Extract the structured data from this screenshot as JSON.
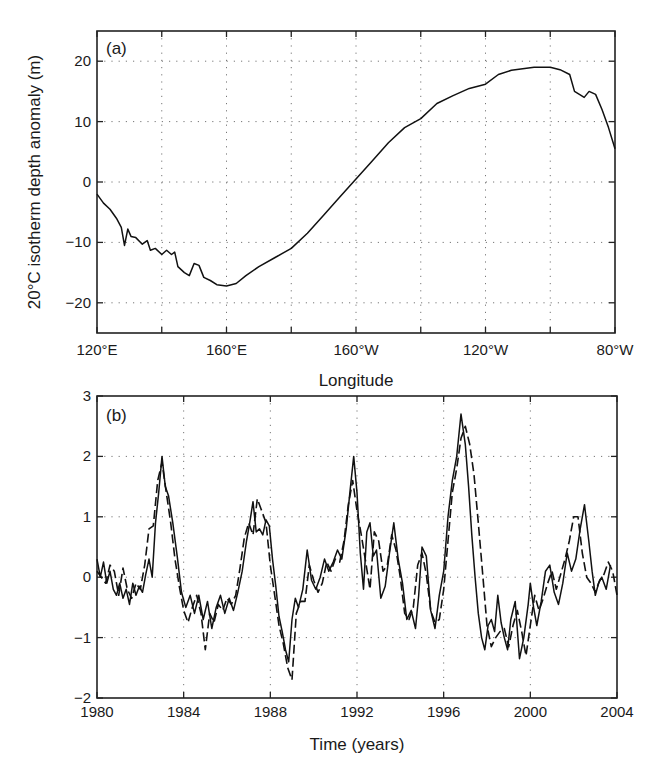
{
  "chart_data": [
    {
      "id": "a",
      "type": "line",
      "panel_label": "(a)",
      "title": "",
      "xlabel": "Longitude",
      "ylabel": "20°C isotherm depth anomaly (m)",
      "xlim": [
        120,
        280
      ],
      "ylim": [
        -25,
        25
      ],
      "x_ticks": [
        120,
        140,
        160,
        180,
        200,
        220,
        240,
        260,
        280
      ],
      "x_tick_labels": [
        "120°E",
        "",
        "160°E",
        "",
        "160°W",
        "",
        "120°W",
        "",
        "80°W"
      ],
      "y_ticks": [
        -20,
        -10,
        0,
        10,
        20
      ],
      "y_tick_labels": [
        "−20",
        "−10",
        "0",
        "10",
        "20"
      ],
      "grid": true,
      "series": [
        {
          "name": "20°C isotherm depth anomaly",
          "style": "solid",
          "x": [
            120,
            122,
            124,
            126,
            127.5,
            128.5,
            129.5,
            130.5,
            132,
            134,
            135.5,
            136.5,
            138,
            140,
            141.5,
            143,
            144,
            145,
            147,
            148.5,
            150,
            151.5,
            153,
            155,
            157,
            160,
            163,
            166,
            170,
            175,
            180,
            185,
            190,
            195,
            200,
            205,
            210,
            215,
            220,
            225,
            230,
            235,
            240,
            244,
            248,
            255,
            260,
            263,
            266,
            267.5,
            269,
            270.5,
            272,
            274,
            276,
            278,
            280
          ],
          "y": [
            -2,
            -3.5,
            -4.5,
            -6,
            -7.5,
            -10.5,
            -7.8,
            -9,
            -9.2,
            -10.3,
            -9.7,
            -11.3,
            -11,
            -12,
            -11.3,
            -12,
            -11.6,
            -14,
            -15,
            -15.5,
            -13.5,
            -13.8,
            -15.8,
            -16.3,
            -17,
            -17.2,
            -16.8,
            -15.5,
            -14,
            -12.5,
            -11,
            -8.5,
            -5.5,
            -2.5,
            0.5,
            3.5,
            6.5,
            9,
            10.5,
            13,
            14.3,
            15.5,
            16.2,
            17.8,
            18.5,
            19,
            19,
            18.6,
            17.8,
            15,
            14.5,
            14,
            15,
            14.5,
            12,
            9,
            5.5
          ]
        }
      ]
    },
    {
      "id": "b",
      "type": "line",
      "panel_label": "(b)",
      "title": "",
      "xlabel": "Time (years)",
      "ylabel": "",
      "xlim": [
        1980,
        2004
      ],
      "ylim": [
        -2,
        3
      ],
      "x_ticks": [
        1980,
        1984,
        1988,
        1992,
        1996,
        2000,
        2004
      ],
      "x_tick_labels": [
        "1980",
        "1984",
        "1988",
        "1992",
        "1996",
        "2000",
        "2004"
      ],
      "y_ticks": [
        -2,
        -1,
        0,
        1,
        2,
        3
      ],
      "y_tick_labels": [
        "−2",
        "−1",
        "0",
        "1",
        "2",
        "3"
      ],
      "grid": true,
      "series": [
        {
          "name": "solid",
          "style": "solid",
          "x": [
            1980.0,
            1980.15,
            1980.3,
            1980.45,
            1980.6,
            1980.75,
            1980.9,
            1981.05,
            1981.2,
            1981.35,
            1981.5,
            1981.65,
            1981.8,
            1981.95,
            1982.1,
            1982.25,
            1982.4,
            1982.55,
            1982.7,
            1982.85,
            1983.0,
            1983.15,
            1983.3,
            1983.5,
            1983.7,
            1983.9,
            1984.1,
            1984.3,
            1984.5,
            1984.7,
            1984.9,
            1985.1,
            1985.3,
            1985.5,
            1985.7,
            1985.9,
            1986.1,
            1986.3,
            1986.5,
            1986.7,
            1986.9,
            1987.05,
            1987.2,
            1987.35,
            1987.5,
            1987.65,
            1987.8,
            1987.95,
            1988.1,
            1988.25,
            1988.4,
            1988.55,
            1988.7,
            1988.85,
            1989.0,
            1989.15,
            1989.3,
            1989.5,
            1989.7,
            1989.9,
            1990.1,
            1990.3,
            1990.5,
            1990.7,
            1990.9,
            1991.1,
            1991.3,
            1991.5,
            1991.7,
            1991.85,
            1992.0,
            1992.15,
            1992.3,
            1992.45,
            1992.6,
            1992.75,
            1992.9,
            1993.1,
            1993.3,
            1993.5,
            1993.7,
            1993.9,
            1994.1,
            1994.3,
            1994.5,
            1994.7,
            1994.85,
            1995.0,
            1995.2,
            1995.4,
            1995.6,
            1995.8,
            1996.0,
            1996.2,
            1996.4,
            1996.6,
            1996.8,
            1997.0,
            1997.15,
            1997.3,
            1997.45,
            1997.6,
            1997.75,
            1997.9,
            1998.05,
            1998.2,
            1998.35,
            1998.5,
            1998.65,
            1998.8,
            1998.95,
            1999.1,
            1999.3,
            1999.5,
            1999.7,
            1999.9,
            2000.0,
            2000.15,
            2000.3,
            2000.5,
            2000.7,
            2000.9,
            2001.1,
            2001.3,
            2001.5,
            2001.7,
            2001.9,
            2002.1,
            2002.3,
            2002.5,
            2002.7,
            2002.85,
            2003.0,
            2003.15,
            2003.3,
            2003.5,
            2003.7,
            2003.9,
            2004.0
          ],
          "y": [
            0.3,
            0.0,
            0.25,
            -0.1,
            0.1,
            -0.2,
            -0.3,
            -0.1,
            -0.35,
            -0.2,
            -0.45,
            -0.1,
            -0.3,
            -0.15,
            -0.25,
            0.05,
            0.3,
            0.0,
            0.9,
            1.4,
            2.0,
            1.5,
            1.35,
            0.9,
            0.35,
            -0.25,
            -0.5,
            -0.3,
            -0.6,
            -0.3,
            -0.7,
            -0.4,
            -0.85,
            -0.5,
            -0.3,
            -0.6,
            -0.35,
            -0.55,
            -0.25,
            0.1,
            0.6,
            0.9,
            1.25,
            0.75,
            0.8,
            0.7,
            0.95,
            0.85,
            0.3,
            -0.15,
            -0.65,
            -0.9,
            -1.2,
            -1.4,
            -0.7,
            -0.35,
            -0.5,
            -0.2,
            0.45,
            -0.05,
            -0.2,
            0.0,
            0.3,
            0.1,
            0.25,
            0.45,
            0.3,
            0.8,
            1.5,
            2.0,
            1.4,
            0.4,
            -0.2,
            0.75,
            0.9,
            0.35,
            0.45,
            -0.35,
            -0.15,
            0.4,
            0.9,
            0.3,
            -0.1,
            -0.7,
            -0.55,
            -0.85,
            -0.3,
            0.5,
            0.35,
            -0.55,
            -0.85,
            -0.3,
            0.1,
            1.0,
            1.6,
            2.0,
            2.7,
            2.2,
            1.5,
            0.7,
            0.0,
            -0.6,
            -1.0,
            -1.2,
            -0.8,
            -0.7,
            -0.9,
            -0.3,
            -0.75,
            -1.0,
            -1.2,
            -0.7,
            -0.4,
            -1.35,
            -1.0,
            -0.45,
            -0.1,
            -0.5,
            -0.8,
            -0.4,
            0.1,
            0.2,
            -0.25,
            -0.45,
            -0.1,
            0.4,
            0.1,
            0.3,
            0.8,
            1.2,
            0.6,
            0.1,
            -0.3,
            -0.1,
            0.0,
            -0.2,
            0.2
          ]
        },
        {
          "name": "dashed",
          "style": "dashed",
          "x": [
            1980.0,
            1980.2,
            1980.4,
            1980.6,
            1980.8,
            1981.0,
            1981.2,
            1981.4,
            1981.6,
            1981.8,
            1982.0,
            1982.2,
            1982.4,
            1982.6,
            1982.8,
            1983.0,
            1983.2,
            1983.4,
            1983.6,
            1983.8,
            1984.0,
            1984.2,
            1984.4,
            1984.6,
            1984.8,
            1985.0,
            1985.2,
            1985.4,
            1985.6,
            1985.8,
            1986.0,
            1986.2,
            1986.4,
            1986.6,
            1986.8,
            1987.0,
            1987.2,
            1987.4,
            1987.6,
            1987.8,
            1988.0,
            1988.2,
            1988.4,
            1988.6,
            1988.8,
            1989.0,
            1989.2,
            1989.4,
            1989.6,
            1989.8,
            1990.0,
            1990.2,
            1990.4,
            1990.6,
            1990.8,
            1991.0,
            1991.2,
            1991.4,
            1991.6,
            1991.8,
            1992.0,
            1992.2,
            1992.4,
            1992.6,
            1992.8,
            1993.0,
            1993.2,
            1993.4,
            1993.6,
            1993.8,
            1994.0,
            1994.2,
            1994.4,
            1994.6,
            1994.8,
            1995.0,
            1995.2,
            1995.4,
            1995.6,
            1995.8,
            1996.0,
            1996.2,
            1996.4,
            1996.6,
            1996.8,
            1997.0,
            1997.2,
            1997.4,
            1997.6,
            1997.8,
            1998.0,
            1998.2,
            1998.4,
            1998.6,
            1998.8,
            1999.0,
            1999.2,
            1999.4,
            1999.6,
            1999.8,
            2000.0,
            2000.2,
            2000.4,
            2000.6,
            2000.8,
            2001.0,
            2001.2,
            2001.4,
            2001.6,
            2001.8,
            2002.0,
            2002.2,
            2002.4,
            2002.6,
            2002.8,
            2003.0,
            2003.2,
            2003.4,
            2003.6,
            2003.8,
            2004.0
          ],
          "y": [
            0.1,
            0.0,
            -0.1,
            0.2,
            0.1,
            -0.3,
            0.15,
            -0.2,
            -0.35,
            -0.1,
            -0.2,
            0.2,
            0.8,
            0.85,
            1.6,
            1.9,
            1.4,
            0.9,
            0.3,
            -0.15,
            -0.55,
            -0.75,
            -0.5,
            -0.3,
            -0.6,
            -1.2,
            -0.6,
            -0.75,
            -0.45,
            -0.55,
            -0.35,
            -0.45,
            -0.3,
            0.15,
            0.65,
            0.9,
            0.7,
            1.3,
            1.1,
            0.9,
            0.2,
            -0.3,
            -0.8,
            -1.1,
            -1.5,
            -1.7,
            -0.6,
            -0.4,
            -0.4,
            0.2,
            -0.05,
            -0.25,
            -0.1,
            0.25,
            0.1,
            0.3,
            0.25,
            0.6,
            1.2,
            1.6,
            1.1,
            0.7,
            0.25,
            -0.2,
            0.75,
            0.6,
            0.1,
            0.2,
            0.7,
            0.45,
            0.0,
            -0.6,
            -0.7,
            -0.5,
            0.2,
            0.4,
            0.05,
            -0.55,
            -0.75,
            -0.7,
            -0.2,
            0.6,
            1.4,
            1.8,
            2.3,
            2.5,
            2.2,
            1.7,
            0.9,
            0.05,
            -0.8,
            -1.15,
            -1.0,
            -0.9,
            -0.85,
            -1.15,
            -0.8,
            -0.55,
            -0.9,
            -1.3,
            -0.8,
            -0.3,
            -0.55,
            -0.35,
            -0.1,
            0.1,
            -0.2,
            0.05,
            0.3,
            0.6,
            1.0,
            1.0,
            0.4,
            0.0,
            -0.1,
            -0.25,
            -0.05,
            0.05,
            0.25,
            0.1,
            -0.3
          ]
        }
      ]
    }
  ]
}
